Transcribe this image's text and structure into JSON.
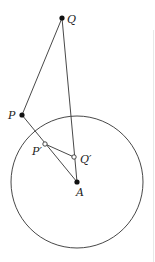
{
  "diagram": {
    "title": "",
    "colors": {
      "stroke": "#333333",
      "point": "#111111",
      "background": "#ffffff"
    },
    "circle": {
      "center_label": "A",
      "cx": 77,
      "cy": 182,
      "r": 66
    },
    "points": [
      {
        "id": "Q",
        "label": "Q",
        "x": 62,
        "y": 18,
        "style": "filled"
      },
      {
        "id": "P",
        "label": "P",
        "x": 22,
        "y": 115,
        "style": "filled"
      },
      {
        "id": "P_prime",
        "label": "P′",
        "x": 45,
        "y": 144,
        "style": "hollow"
      },
      {
        "id": "Q_prime",
        "label": "Q′",
        "x": 74,
        "y": 157,
        "style": "hollow"
      },
      {
        "id": "A",
        "label": "A",
        "x": 77,
        "y": 182,
        "style": "filled"
      }
    ],
    "segments": [
      {
        "from": "Q",
        "to": "P"
      },
      {
        "from": "Q",
        "to": "A"
      },
      {
        "from": "P",
        "to": "A"
      },
      {
        "from": "P_prime",
        "to": "Q_prime"
      }
    ],
    "labels": {
      "Q": "Q",
      "P": "P",
      "P_prime": "P′",
      "Q_prime": "Q′",
      "A": "A"
    }
  }
}
